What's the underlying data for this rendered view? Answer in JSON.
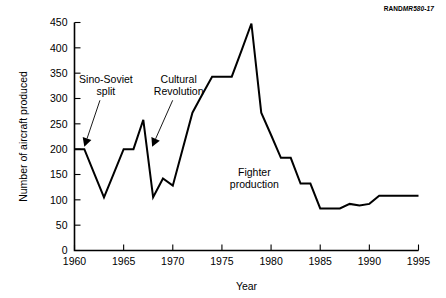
{
  "figure": {
    "doc_number_prefix": "RAND",
    "doc_number_italic": "MR580-17"
  },
  "chart_data": {
    "type": "line",
    "title": "",
    "xlabel": "Year",
    "ylabel": "Number of aircraft produced",
    "xlim": [
      1960,
      1995
    ],
    "ylim": [
      0,
      450
    ],
    "xticks": [
      1960,
      1965,
      1970,
      1975,
      1980,
      1985,
      1990,
      1995
    ],
    "xtick_labels": [
      "1960",
      "1965",
      "1970",
      "1975",
      "1980",
      "1985",
      "1990",
      "1995"
    ],
    "yticks": [
      0,
      50,
      100,
      150,
      200,
      250,
      300,
      350,
      400,
      450
    ],
    "ytick_labels": [
      "0",
      "50",
      "100",
      "150",
      "200",
      "250",
      "300",
      "350",
      "400",
      "450"
    ],
    "grid": false,
    "legend": false,
    "series": [
      {
        "name": "Fighter production",
        "x": [
          1960,
          1961,
          1962,
          1963,
          1964,
          1965,
          1966,
          1967,
          1968,
          1969,
          1970,
          1971,
          1972,
          1973,
          1974,
          1975,
          1976,
          1977,
          1978,
          1979,
          1980,
          1981,
          1982,
          1983,
          1984,
          1985,
          1986,
          1987,
          1988,
          1989,
          1990,
          1991,
          1992,
          1993,
          1994,
          1995
        ],
        "values": [
          200,
          200,
          152,
          105,
          152,
          200,
          200,
          258,
          105,
          142,
          128,
          200,
          272,
          308,
          343,
          343,
          343,
          395,
          448,
          272,
          228,
          183,
          183,
          132,
          132,
          83,
          83,
          83,
          92,
          89,
          92,
          108,
          108,
          108,
          108,
          108
        ]
      }
    ],
    "annotations": [
      {
        "id": "sino-soviet-split",
        "text_lines": [
          "Sino-Soviet",
          "split"
        ],
        "label_x": 1963.2,
        "label_y": 330,
        "point_x": 1961.0,
        "point_y": 205
      },
      {
        "id": "cultural-revolution",
        "text_lines": [
          "Cultural",
          "Revolution"
        ],
        "label_x": 1970.6,
        "label_y": 330,
        "point_x": 1967.9,
        "point_y": 205
      },
      {
        "id": "fighter-production",
        "text_lines": [
          "Fighter",
          "production"
        ],
        "label_x": 1978.3,
        "label_y": 148,
        "point_x": null,
        "point_y": null
      }
    ]
  }
}
